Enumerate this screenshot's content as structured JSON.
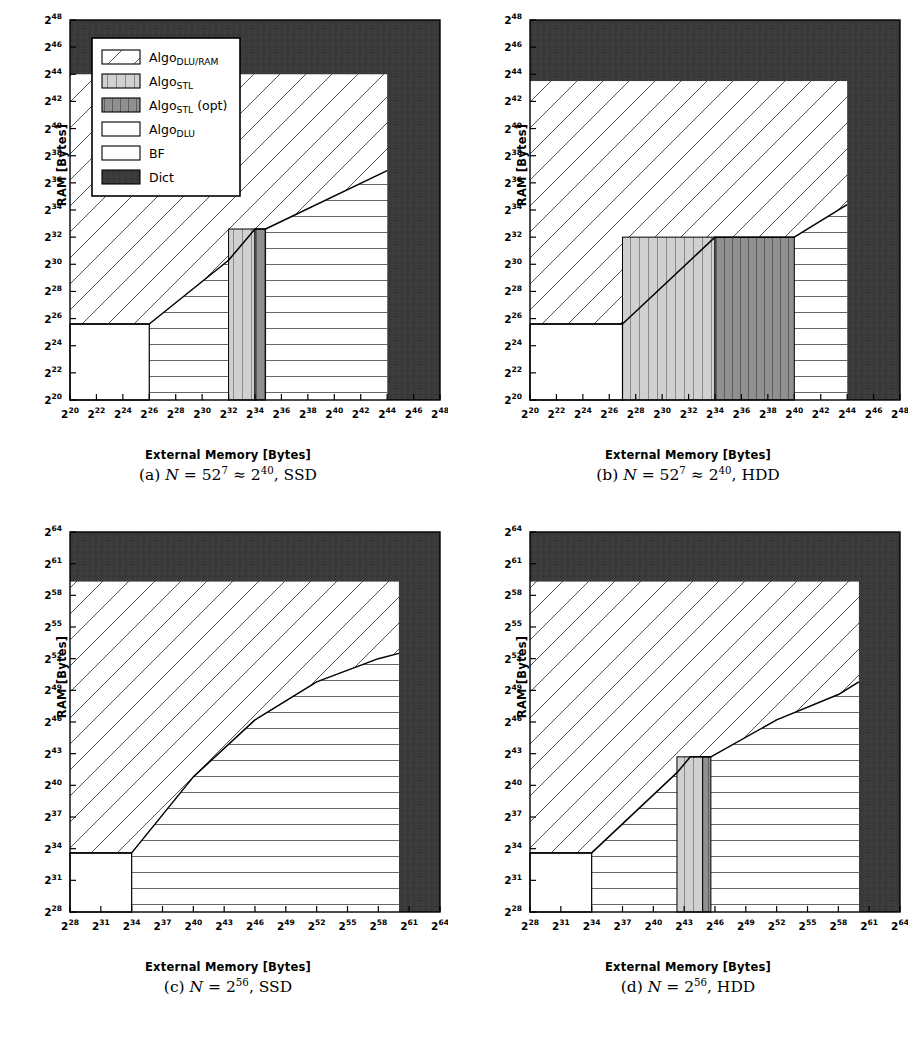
{
  "figure": {
    "axis_labels": {
      "x": "External Memory [Bytes]",
      "y": "RAM [Bytes]"
    }
  },
  "legend": {
    "entries": [
      {
        "key": "algo_dlu_ram",
        "label_main": "Algo",
        "label_sub": "DLU/RAM",
        "label_suffix": "",
        "pattern": "diagonal-hatch",
        "fill": "#ffffff"
      },
      {
        "key": "algo_stl",
        "label_main": "Algo",
        "label_sub": "STL",
        "label_suffix": "",
        "pattern": "vertical-hatch-light",
        "fill": "#d0d0d0"
      },
      {
        "key": "algo_stl_opt",
        "label_main": "Algo",
        "label_sub": "STL",
        "label_suffix": " (opt)",
        "pattern": "vertical-hatch-dark",
        "fill": "#909090"
      },
      {
        "key": "algo_dlu",
        "label_main": "Algo",
        "label_sub": "DLU",
        "label_suffix": "",
        "pattern": "horizontal-hatch",
        "fill": "#ffffff"
      },
      {
        "key": "bf",
        "label_main": "BF",
        "label_sub": "",
        "label_suffix": "",
        "pattern": "solid-white",
        "fill": "#ffffff"
      },
      {
        "key": "dict",
        "label_main": "Dict",
        "label_sub": "",
        "label_suffix": "",
        "pattern": "solid-dark",
        "fill": "#3a3a3a"
      }
    ]
  },
  "colors": {
    "dict": "#3a3a3a",
    "stl_light": "#d0d0d0",
    "stl_opt": "#909090",
    "line": "#000000",
    "background": "#ffffff"
  },
  "chart_data": [
    {
      "id": "a",
      "type": "area",
      "caption_prefix": "(a)",
      "caption_N": "N",
      "caption_value": "= 52",
      "caption_exp": "7",
      "caption_approx": "≈ 2",
      "caption_approx_exp": "40",
      "caption_device": ", SSD",
      "title": "N = 52^7 ≈ 2^40, SSD",
      "xlabel": "External Memory [Bytes]",
      "ylabel": "RAM [Bytes]",
      "xlim": [
        20,
        48
      ],
      "ylim": [
        20,
        48
      ],
      "xticks": [
        20,
        22,
        24,
        26,
        28,
        30,
        32,
        34,
        36,
        38,
        40,
        42,
        44,
        46,
        48
      ],
      "yticks": [
        20,
        22,
        24,
        26,
        28,
        30,
        32,
        34,
        36,
        38,
        40,
        42,
        44,
        46,
        48
      ],
      "tick_prefix": "2",
      "grid": false,
      "regions": {
        "dict_x_start": 44,
        "dict_y_start": 44,
        "bf": {
          "x": [
            20,
            26
          ],
          "y": [
            20,
            25.6
          ]
        },
        "stl_light": {
          "x": [
            32,
            34
          ],
          "y_top": 32.6
        },
        "stl_opt": {
          "x": [
            34,
            34.8
          ],
          "y_top": 32.6
        },
        "boundary_points": [
          [
            20,
            25.6
          ],
          [
            26,
            25.6
          ],
          [
            32,
            30.3
          ],
          [
            34,
            32.6
          ],
          [
            34.8,
            32.6
          ],
          [
            44,
            36.9
          ]
        ]
      }
    },
    {
      "id": "b",
      "type": "area",
      "caption_prefix": "(b)",
      "caption_N": "N",
      "caption_value": "= 52",
      "caption_exp": "7",
      "caption_approx": "≈ 2",
      "caption_approx_exp": "40",
      "caption_device": ", HDD",
      "title": "N = 52^7 ≈ 2^40, HDD",
      "xlabel": "External Memory [Bytes]",
      "ylabel": "RAM [Bytes]",
      "xlim": [
        20,
        48
      ],
      "ylim": [
        20,
        48
      ],
      "xticks": [
        20,
        22,
        24,
        26,
        28,
        30,
        32,
        34,
        36,
        38,
        40,
        42,
        44,
        46,
        48
      ],
      "yticks": [
        20,
        22,
        24,
        26,
        28,
        30,
        32,
        34,
        36,
        38,
        40,
        42,
        44,
        46,
        48
      ],
      "tick_prefix": "2",
      "grid": false,
      "regions": {
        "dict_x_start": 44,
        "dict_y_start": 43.5,
        "bf": {
          "x": [
            20,
            27
          ],
          "y": [
            20,
            25.6
          ]
        },
        "stl_light": {
          "x": [
            27,
            34
          ],
          "y_top": 32
        },
        "stl_opt": {
          "x": [
            34,
            40
          ],
          "y_top": 32
        },
        "boundary_points": [
          [
            20,
            25.6
          ],
          [
            27,
            25.6
          ],
          [
            34,
            32
          ],
          [
            40,
            32
          ],
          [
            44,
            34.4
          ]
        ]
      }
    },
    {
      "id": "c",
      "type": "area",
      "caption_prefix": "(c)",
      "caption_N": "N",
      "caption_value": "= 2",
      "caption_exp": "56",
      "caption_approx": "",
      "caption_approx_exp": "",
      "caption_device": ", SSD",
      "title": "N = 2^56, SSD",
      "xlabel": "External Memory [Bytes]",
      "ylabel": "RAM [Bytes]",
      "xlim": [
        28,
        64
      ],
      "ylim": [
        28,
        64
      ],
      "xticks": [
        28,
        31,
        34,
        37,
        40,
        43,
        46,
        49,
        52,
        55,
        58,
        61,
        64
      ],
      "yticks": [
        28,
        31,
        34,
        37,
        40,
        43,
        46,
        49,
        52,
        55,
        58,
        61,
        64
      ],
      "tick_prefix": "2",
      "grid": false,
      "regions": {
        "dict_x_start": 60,
        "dict_y_start": 59.3,
        "bf": {
          "x": [
            28,
            34
          ],
          "y": [
            28,
            33.6
          ]
        },
        "stl_light": null,
        "stl_opt": null,
        "boundary_points": [
          [
            28,
            33.6
          ],
          [
            34,
            33.6
          ],
          [
            40,
            40.8
          ],
          [
            46,
            46.2
          ],
          [
            52,
            49.8
          ],
          [
            58,
            52
          ],
          [
            60,
            52.5
          ]
        ]
      }
    },
    {
      "id": "d",
      "type": "area",
      "caption_prefix": "(d)",
      "caption_N": "N",
      "caption_value": "= 2",
      "caption_exp": "56",
      "caption_approx": "",
      "caption_approx_exp": "",
      "caption_device": ", HDD",
      "title": "N = 2^56, HDD",
      "xlabel": "External Memory [Bytes]",
      "ylabel": "RAM [Bytes]",
      "xlim": [
        28,
        64
      ],
      "ylim": [
        28,
        64
      ],
      "xticks": [
        28,
        31,
        34,
        37,
        40,
        43,
        46,
        49,
        52,
        55,
        58,
        61,
        64
      ],
      "yticks": [
        28,
        31,
        34,
        37,
        40,
        43,
        46,
        49,
        52,
        55,
        58,
        61,
        64
      ],
      "tick_prefix": "2",
      "grid": false,
      "regions": {
        "dict_x_start": 60,
        "dict_y_start": 59.3,
        "bf": {
          "x": [
            28,
            34
          ],
          "y": [
            28,
            33.6
          ]
        },
        "stl_light": {
          "x": [
            42.3,
            44.8
          ],
          "y_top": 42.7
        },
        "stl_opt": {
          "x": [
            44.8,
            45.6
          ],
          "y_top": 42.7
        },
        "boundary_points": [
          [
            28,
            33.6
          ],
          [
            34,
            33.6
          ],
          [
            42.3,
            41.2
          ],
          [
            43.6,
            42.7
          ],
          [
            45.6,
            42.7
          ],
          [
            52,
            46.2
          ],
          [
            58,
            48.6
          ],
          [
            60,
            49.8
          ]
        ]
      }
    }
  ]
}
